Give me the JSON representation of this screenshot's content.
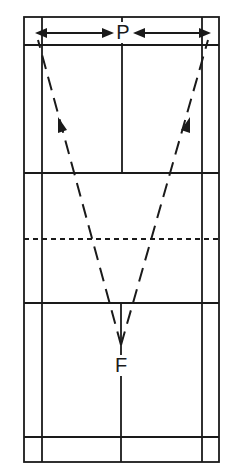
{
  "diagram": {
    "labels": {
      "top_player": "P",
      "bottom_player": "F"
    },
    "court": {
      "outer_left": 24,
      "inner_left": 42,
      "center_x": 122,
      "inner_right": 202,
      "outer_right": 219,
      "top": 17,
      "top_long_service": 45,
      "top_short_service": 173,
      "net": 239,
      "bottom_short_service": 303,
      "bottom_long_service": 437,
      "bottom": 462
    },
    "paths": [
      {
        "name": "left-diagonal",
        "from": [
          121,
          345
        ],
        "to": [
          38,
          38
        ],
        "arrowhead_at": [
          62,
          122
        ]
      },
      {
        "name": "right-diagonal",
        "from": [
          121,
          345
        ],
        "to": [
          208,
          38
        ],
        "arrowhead_at": [
          186,
          122
        ]
      }
    ],
    "horizontal_arrows": [
      {
        "name": "left-arrow",
        "from": [
          112,
          33
        ],
        "to": [
          35,
          33
        ]
      },
      {
        "name": "right-arrow",
        "from": [
          134,
          33
        ],
        "to": [
          211,
          33
        ]
      }
    ],
    "colors": {
      "line": "#1a1a1a",
      "background": "#ffffff"
    }
  }
}
